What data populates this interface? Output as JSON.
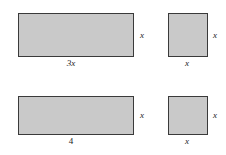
{
  "figure": {
    "type": "algebra-tiles-diagram",
    "background_color": "#ffffff",
    "tile_fill_color": "#c9c9c9",
    "tile_border_color": "#3a3a3a",
    "label_color": "#1c1c1c",
    "tiles": [
      {
        "id": "tile-top-left",
        "name": "wide-rectangle-3x-by-x",
        "x": 18,
        "y": 13,
        "width": 116,
        "height": 44,
        "side_label": "x",
        "bottom_label": "3x",
        "bottom_label_style": "italic"
      },
      {
        "id": "tile-top-right",
        "name": "square-x-by-x-top",
        "x": 168,
        "y": 13,
        "width": 40,
        "height": 44,
        "side_label": "x",
        "bottom_label": "x",
        "bottom_label_style": "italic"
      },
      {
        "id": "tile-bottom-left",
        "name": "wide-rectangle-4-by-x",
        "x": 18,
        "y": 96,
        "width": 116,
        "height": 39,
        "side_label": "x",
        "bottom_label": "4",
        "bottom_label_style": "upright"
      },
      {
        "id": "tile-bottom-right",
        "name": "square-x-by-x-bottom",
        "x": 168,
        "y": 96,
        "width": 40,
        "height": 39,
        "side_label": "x",
        "bottom_label": "x",
        "bottom_label_style": "italic"
      }
    ]
  }
}
